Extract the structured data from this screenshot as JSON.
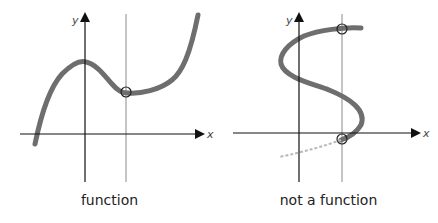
{
  "panels": [
    {
      "caption": "function",
      "x_label": "x",
      "y_label": "y",
      "curve_color": "#6e6e6e",
      "intersections": 1
    },
    {
      "caption": "not a function",
      "x_label": "x",
      "y_label": "y",
      "curve_color": "#6e6e6e",
      "intersections": 2
    }
  ],
  "colors": {
    "axis": "#111111",
    "vertical_line": "#8a8a8a",
    "curve": "#6e6e6e",
    "circle": "#222222"
  }
}
